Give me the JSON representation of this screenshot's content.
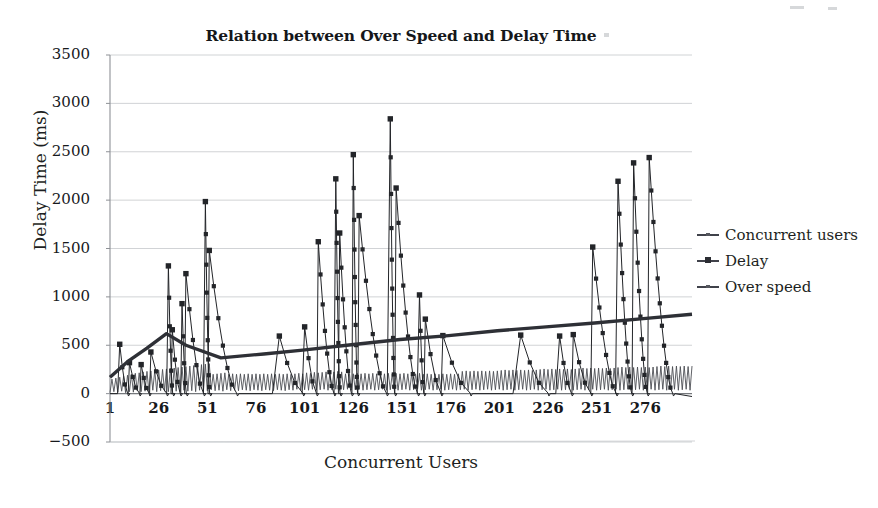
{
  "chart_data": {
    "type": "line",
    "title": "Relation between Over Speed and Delay Time",
    "xlabel": "Concurrent Users",
    "ylabel": "Delay Time (ms)",
    "xlim": [
      1,
      300
    ],
    "ylim": [
      -500,
      3500
    ],
    "ytick_step": 500,
    "xtick_step": 25,
    "grid": true,
    "legend_position": "right",
    "yticks": [
      "3500",
      "3000",
      "2500",
      "2000",
      "1500",
      "1000",
      "500",
      "0",
      "-500"
    ],
    "xticks": [
      "1",
      "26",
      "51",
      "76",
      "101",
      "126",
      "151",
      "176",
      "201",
      "226",
      "251",
      "276"
    ],
    "series": [
      {
        "name": "Concurrent users",
        "color": "#4a4c52",
        "marker": "none",
        "linewidth": 1.0,
        "note": "dense low-amplitude sawtooth baseline oscillating between about 0 and 250 ms, stepping up with load plateaus",
        "values": [
          10,
          150,
          20,
          160,
          15,
          170,
          25,
          180,
          10,
          190,
          20,
          200,
          15,
          210,
          30,
          215,
          20,
          225,
          25,
          230,
          15,
          235,
          35,
          240,
          20,
          245,
          30,
          250,
          25,
          255,
          20,
          260,
          30,
          265,
          25,
          270,
          20,
          275,
          35,
          280,
          25,
          285,
          30,
          290,
          20,
          295,
          35,
          300,
          25,
          305,
          30,
          310,
          40,
          200,
          30,
          205,
          35,
          210,
          25,
          215,
          40,
          200,
          30,
          205,
          35,
          200,
          30,
          205,
          40,
          200,
          35,
          205,
          30,
          200,
          40,
          205,
          35,
          200,
          30,
          205,
          40,
          200,
          35,
          205,
          30,
          200,
          40,
          205,
          35,
          200,
          30,
          205,
          40,
          200,
          35,
          205,
          45,
          210,
          35,
          205,
          40,
          215,
          35,
          210,
          45,
          220,
          35,
          215,
          40,
          220,
          45,
          225,
          35,
          220,
          40,
          225,
          45,
          230,
          35,
          225,
          40,
          205,
          45,
          210,
          35,
          205,
          40,
          210,
          45,
          205,
          35,
          210,
          40,
          205,
          45,
          210,
          35,
          205,
          40,
          210,
          45,
          205,
          35,
          210,
          40,
          205,
          45,
          210,
          35,
          205,
          40,
          210,
          45,
          205,
          35,
          210,
          40,
          205,
          45,
          210,
          35,
          200,
          40,
          205,
          45,
          200,
          35,
          205,
          40,
          200,
          45,
          205,
          35,
          200,
          40,
          205,
          45,
          200,
          35,
          205,
          40,
          230,
          45,
          235,
          35,
          230,
          40,
          235,
          45,
          230,
          35,
          235,
          40,
          230,
          45,
          235,
          35,
          230,
          40,
          235,
          45,
          240,
          35,
          245,
          40,
          240,
          45,
          245,
          35,
          240,
          40,
          245,
          45,
          240,
          35,
          245,
          40,
          240,
          45,
          245,
          35,
          250,
          40,
          255,
          45,
          250,
          35,
          255,
          40,
          250,
          45,
          255,
          35,
          250,
          40,
          255,
          45,
          250,
          35,
          255,
          40,
          260,
          45,
          265,
          35,
          260,
          40,
          265,
          45,
          260,
          35,
          265,
          40,
          260,
          45,
          265,
          35,
          260,
          40,
          265,
          45,
          270,
          35,
          275,
          40,
          270,
          45,
          275,
          35,
          270,
          40,
          275,
          45,
          270,
          35,
          275,
          40,
          270,
          45,
          275,
          35,
          280,
          40,
          285,
          45,
          280,
          35,
          285,
          40,
          280,
          45,
          285,
          35,
          280,
          40,
          285,
          45,
          280,
          35,
          285
        ]
      },
      {
        "name": "Delay",
        "color": "#232529",
        "marker": "square",
        "linewidth": 1.0,
        "note": "spiky series with square markers; sharp peaks at irregular intervals, decaying between peaks toward ~0",
        "peaks": [
          {
            "x": 6,
            "y": 510
          },
          {
            "x": 11,
            "y": 320
          },
          {
            "x": 17,
            "y": 300
          },
          {
            "x": 22,
            "y": 430
          },
          {
            "x": 31,
            "y": 1320
          },
          {
            "x": 33,
            "y": 660
          },
          {
            "x": 40,
            "y": 1240
          },
          {
            "x": 38,
            "y": 930
          },
          {
            "x": 50,
            "y": 1985
          },
          {
            "x": 52,
            "y": 1480
          },
          {
            "x": 88,
            "y": 595
          },
          {
            "x": 101,
            "y": 690
          },
          {
            "x": 108,
            "y": 1570
          },
          {
            "x": 117,
            "y": 2220
          },
          {
            "x": 119,
            "y": 1660
          },
          {
            "x": 126,
            "y": 2470
          },
          {
            "x": 129,
            "y": 1840
          },
          {
            "x": 145,
            "y": 2840
          },
          {
            "x": 148,
            "y": 2125
          },
          {
            "x": 160,
            "y": 1020
          },
          {
            "x": 163,
            "y": 770
          },
          {
            "x": 172,
            "y": 600
          },
          {
            "x": 212,
            "y": 605
          },
          {
            "x": 232,
            "y": 595
          },
          {
            "x": 239,
            "y": 610
          },
          {
            "x": 249,
            "y": 1515
          },
          {
            "x": 262,
            "y": 2195
          },
          {
            "x": 270,
            "y": 2385
          },
          {
            "x": 278,
            "y": 2440
          }
        ],
        "baseline": 0,
        "max_value": 2840,
        "min_value": -40
      },
      {
        "name": "Over speed",
        "color": "#2e3036",
        "marker": "none",
        "linewidth": 3.4,
        "note": "thick near-monotonic trend line; rises steeply from ~170 ms at user 1 to ~620 ms near user 30, dips to ~370 ms, then climbs steadily to ~820 ms at the right edge",
        "points": [
          {
            "x": 1,
            "y": 170
          },
          {
            "x": 10,
            "y": 330
          },
          {
            "x": 20,
            "y": 470
          },
          {
            "x": 30,
            "y": 620
          },
          {
            "x": 40,
            "y": 500
          },
          {
            "x": 58,
            "y": 370
          },
          {
            "x": 80,
            "y": 410
          },
          {
            "x": 100,
            "y": 450
          },
          {
            "x": 125,
            "y": 505
          },
          {
            "x": 150,
            "y": 560
          },
          {
            "x": 175,
            "y": 600
          },
          {
            "x": 200,
            "y": 650
          },
          {
            "x": 225,
            "y": 690
          },
          {
            "x": 250,
            "y": 730
          },
          {
            "x": 275,
            "y": 775
          },
          {
            "x": 300,
            "y": 820
          }
        ]
      }
    ]
  },
  "legend": {
    "items": [
      {
        "label": "Concurrent users",
        "symbol": "line-marker"
      },
      {
        "label": "Delay",
        "symbol": "line-square-marker"
      },
      {
        "label": "Over speed",
        "symbol": "line-marker"
      }
    ]
  },
  "colors": {
    "axis": "#8e9196",
    "grid": "#b9bcc1",
    "ink": "#1d1f22",
    "delay": "#232529",
    "concurrent": "#4a4c52",
    "overspeed": "#2e3036",
    "background": "#ffffff"
  }
}
